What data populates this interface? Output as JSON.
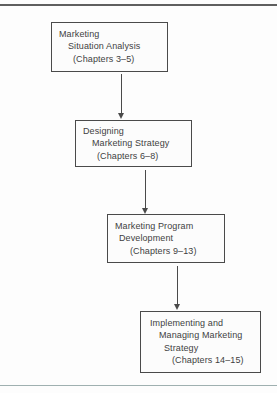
{
  "colors": {
    "ink": "#3f3f3f",
    "border": "#4a4a4a",
    "rule_top": "#5f5f5f",
    "rule_bottom": "#9fb0b0",
    "page_bg": "#fdfdfd",
    "box_bg": "#fcfcfc"
  },
  "flowchart": {
    "boxes": [
      {
        "id": "situation-analysis",
        "lines": [
          "Marketing",
          "Situation Analysis",
          "(Chapters 3–5)"
        ]
      },
      {
        "id": "designing-strategy",
        "lines": [
          "Designing",
          "Marketing Strategy",
          "(Chapters 6–8)"
        ]
      },
      {
        "id": "program-development",
        "lines": [
          "Marketing Program",
          "Development",
          "(Chapters 9–13)"
        ]
      },
      {
        "id": "implementing-managing",
        "lines": [
          "Implementing and",
          "Managing Marketing",
          "Strategy",
          "(Chapters 14–15)"
        ]
      }
    ],
    "connectors": [
      {
        "type": "arrow-down",
        "from": "situation-analysis",
        "to": "designing-strategy"
      },
      {
        "type": "arrow-down",
        "from": "designing-strategy",
        "to": "program-development"
      },
      {
        "type": "arrow-down",
        "from": "program-development",
        "to": "implementing-managing"
      }
    ]
  }
}
